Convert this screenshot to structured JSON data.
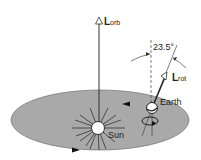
{
  "labels": {
    "lorb_main": "L",
    "lorb_sub": "orb",
    "lrot_main": "L",
    "lrot_sub": "rot",
    "angle": "23.5°",
    "earth": "Earth",
    "sun": "Sun"
  },
  "colors": {
    "orbit_fill": "#a9a9a9",
    "line": "#333333"
  }
}
